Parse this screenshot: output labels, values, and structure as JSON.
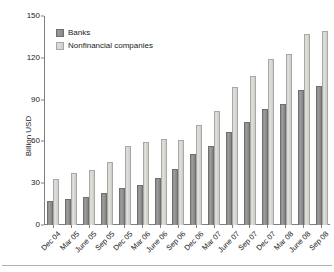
{
  "chart_data": {
    "type": "bar",
    "title": "",
    "subtitle": "",
    "xlabel": "",
    "ylabel": "Billion USD",
    "ylim": [
      0,
      150
    ],
    "yticks": [
      0,
      30,
      60,
      90,
      120,
      150
    ],
    "grid": false,
    "legend_position": "top-left",
    "categories": [
      "Dec 04",
      "Mar 05",
      "June 05",
      "Sep 05",
      "Dec 05",
      "Mar 06",
      "June 06",
      "Sep 06",
      "Dec 06",
      "Mar 07",
      "June 07",
      "Sep 07",
      "Dec 07",
      "Mar 08",
      "June 08",
      "Sep 08"
    ],
    "series": [
      {
        "name": "Banks",
        "color": "#8e8e8e",
        "values": [
          17,
          18.5,
          20,
          23,
          26.5,
          29,
          34,
          40,
          51,
          57,
          66.5,
          74,
          83,
          87,
          97,
          100
        ]
      },
      {
        "name": "Nonfinancial companies",
        "color": "#d6d6d2",
        "values": [
          33,
          37.5,
          39.5,
          45.5,
          57,
          59.5,
          62,
          61,
          72,
          82,
          99,
          107,
          119,
          123,
          137,
          139
        ]
      }
    ]
  },
  "legend": {
    "items": [
      {
        "label": "Banks",
        "key": "banks"
      },
      {
        "label": "Nonfinancial companies",
        "key": "nonfin"
      }
    ]
  }
}
